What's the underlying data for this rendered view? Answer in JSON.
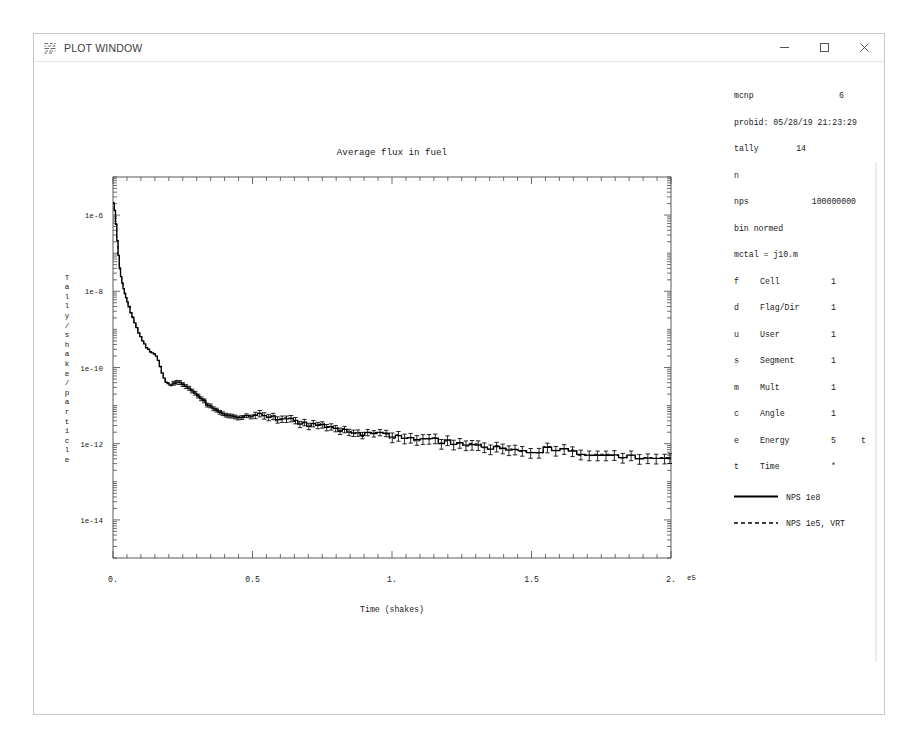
{
  "window": {
    "title": "PLOT WINDOW",
    "icon": "mcnp-plot-icon",
    "controls": {
      "minimize": "minimize-icon",
      "maximize": "maximize-icon",
      "close": "close-icon"
    }
  },
  "info_panel": {
    "code_label": "mcnp",
    "code_version": "6",
    "probid": "probid: 05/28/19 21:23:29",
    "tally_label": "tally",
    "tally_number": "14",
    "particle": "n",
    "nps_label": "nps",
    "nps_value": "100000000",
    "normalization": "bin normed",
    "mctal": "mctal = j10.m",
    "bins": [
      {
        "key": "f",
        "name": "Cell",
        "value": "1",
        "flag": ""
      },
      {
        "key": "d",
        "name": "Flag/Dir",
        "value": "1",
        "flag": ""
      },
      {
        "key": "u",
        "name": "User",
        "value": "1",
        "flag": ""
      },
      {
        "key": "s",
        "name": "Segment",
        "value": "1",
        "flag": ""
      },
      {
        "key": "m",
        "name": "Mult",
        "value": "1",
        "flag": ""
      },
      {
        "key": "c",
        "name": "Angle",
        "value": "1",
        "flag": ""
      },
      {
        "key": "e",
        "name": "Energy",
        "value": "5",
        "flag": "t"
      },
      {
        "key": "t",
        "name": "Time",
        "value": "*",
        "flag": ""
      }
    ],
    "legend": [
      {
        "label": "NPS 1e8",
        "style": "solid"
      },
      {
        "label": "NPS 1e5, VRT",
        "style": "dashed"
      }
    ]
  },
  "chart_data": {
    "type": "line",
    "title": "Average flux in fuel",
    "xlabel": "Time (shakes)",
    "ylabel": "Tally/shake/particle",
    "ylabel_chars": [
      "T",
      "a",
      "l",
      "l",
      "y",
      "/",
      "s",
      "h",
      "a",
      "k",
      "e",
      "/",
      "p",
      "a",
      "r",
      "t",
      "i",
      "c",
      "l",
      "e"
    ],
    "xscale": "linear",
    "yscale": "log",
    "xlim": [
      0,
      2.0
    ],
    "ylim": [
      1e-15,
      1e-05
    ],
    "x_exponent": "e5",
    "x_exponent_factor": 100000,
    "xticks": [
      0,
      0.5,
      1.0,
      1.5,
      2.0
    ],
    "xticklabels": [
      "0.",
      "0.5",
      "1.",
      "1.5",
      "2."
    ],
    "x_minor_per_major": 10,
    "yticks": [
      1e-06,
      1e-08,
      1e-10,
      1e-12,
      1e-14
    ],
    "yticklabels": [
      "1e-6",
      "1e-8",
      "1e-10",
      "1e-12",
      "1e-14"
    ],
    "grid": false,
    "legend_position": "right-panel",
    "drawstyle": "steps",
    "errorbars": true,
    "series": [
      {
        "name": "NPS 1e8",
        "style": "solid",
        "color": "#000000",
        "anchors": [
          [
            0.0,
            2.2e-06
          ],
          [
            0.004,
            1.9e-06
          ],
          [
            0.008,
            1.1e-06
          ],
          [
            0.013,
            4e-07
          ],
          [
            0.018,
            1.3e-07
          ],
          [
            0.024,
            4.5e-08
          ],
          [
            0.03,
            2.2e-08
          ],
          [
            0.038,
            1.2e-08
          ],
          [
            0.048,
            6.5e-09
          ],
          [
            0.06,
            3.4e-09
          ],
          [
            0.075,
            1.7e-09
          ],
          [
            0.09,
            9e-10
          ],
          [
            0.105,
            5.2e-10
          ],
          [
            0.12,
            3.4e-10
          ],
          [
            0.135,
            2.6e-10
          ],
          [
            0.148,
            2.3e-10
          ],
          [
            0.158,
            1.9e-10
          ],
          [
            0.168,
            1.2e-10
          ],
          [
            0.178,
            6.5e-11
          ],
          [
            0.19,
            4.2e-11
          ],
          [
            0.2,
            3.6e-11
          ],
          [
            0.215,
            3.9e-11
          ],
          [
            0.23,
            4.3e-11
          ],
          [
            0.245,
            4.1e-11
          ],
          [
            0.26,
            3.4e-11
          ],
          [
            0.28,
            2.6e-11
          ],
          [
            0.3,
            1.9e-11
          ],
          [
            0.32,
            1.4e-11
          ],
          [
            0.345,
            1e-11
          ],
          [
            0.37,
            7.6e-12
          ],
          [
            0.395,
            6e-12
          ],
          [
            0.42,
            5.2e-12
          ],
          [
            0.45,
            4.9e-12
          ],
          [
            0.48,
            5.2e-12
          ],
          [
            0.51,
            5.6e-12
          ],
          [
            0.54,
            5.6e-12
          ],
          [
            0.57,
            5.2e-12
          ],
          [
            0.6,
            4.6e-12
          ],
          [
            0.64,
            4e-12
          ],
          [
            0.68,
            3.5e-12
          ],
          [
            0.72,
            3.1e-12
          ],
          [
            0.76,
            2.8e-12
          ],
          [
            0.8,
            2.5e-12
          ],
          [
            0.85,
            2.2e-12
          ],
          [
            0.9,
            1.95e-12
          ],
          [
            0.95,
            1.75e-12
          ],
          [
            1.0,
            1.55e-12
          ],
          [
            1.06,
            1.38e-12
          ],
          [
            1.12,
            1.22e-12
          ],
          [
            1.18,
            1.1e-12
          ],
          [
            1.25,
            9.8e-13
          ],
          [
            1.32,
            8.8e-13
          ],
          [
            1.4,
            7.8e-13
          ],
          [
            1.48,
            7e-13
          ],
          [
            1.56,
            6.3e-13
          ],
          [
            1.64,
            5.7e-13
          ],
          [
            1.72,
            5.2e-13
          ],
          [
            1.8,
            4.8e-13
          ],
          [
            1.88,
            4.5e-13
          ],
          [
            1.95,
            4.4e-13
          ],
          [
            2.0,
            4.4e-13
          ]
        ]
      },
      {
        "name": "NPS 1e5, VRT",
        "style": "dashed",
        "color": "#000000",
        "note": "overlays the solid curve almost everywhere; visible as short dashes in the tail"
      }
    ]
  }
}
